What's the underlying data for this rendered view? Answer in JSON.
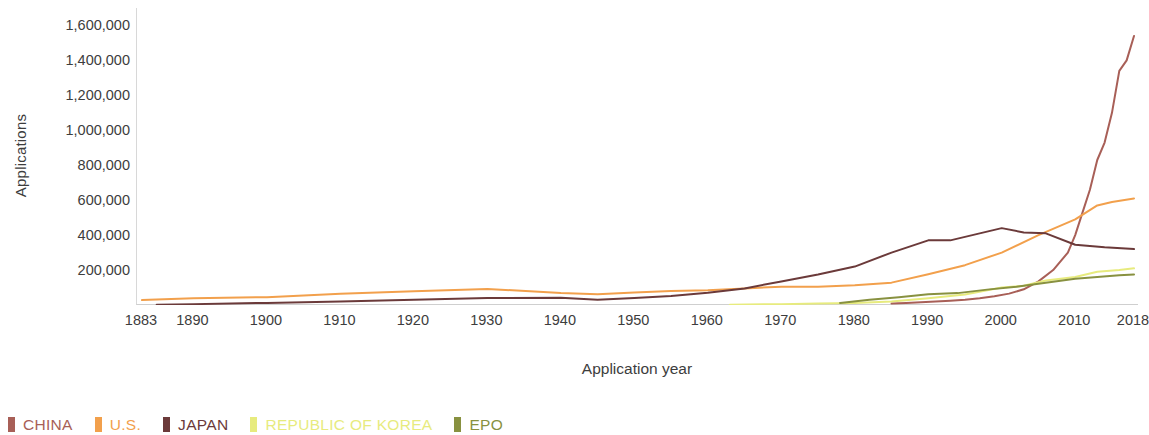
{
  "chart_data": {
    "type": "line",
    "title": "",
    "xlabel": "Application year",
    "ylabel": "Applications",
    "xlim": [
      1883,
      2018
    ],
    "ylim": [
      0,
      1700000
    ],
    "grid": false,
    "legend_position": "bottom-left",
    "x_ticks": [
      "1883",
      "1890",
      "1900",
      "1910",
      "1920",
      "1930",
      "1940",
      "1950",
      "1960",
      "1970",
      "1980",
      "1990",
      "2000",
      "2010",
      "2018"
    ],
    "x_tick_values": [
      1883,
      1890,
      1900,
      1910,
      1920,
      1930,
      1940,
      1950,
      1960,
      1970,
      1980,
      1990,
      2000,
      2010,
      2018
    ],
    "y_ticks": [
      "200,000",
      "400,000",
      "600,000",
      "800,000",
      "1,000,000",
      "1,200,000",
      "1,400,000",
      "1,600,000"
    ],
    "y_tick_values": [
      200000,
      400000,
      600000,
      800000,
      1000000,
      1200000,
      1400000,
      1600000
    ],
    "series": [
      {
        "name": "CHINA",
        "color": "#a85f57",
        "x": [
          1985,
          1987,
          1989,
          1991,
          1993,
          1995,
          1997,
          1999,
          2001,
          2003,
          2005,
          2007,
          2009,
          2010,
          2011,
          2012,
          2013,
          2014,
          2015,
          2016,
          2017,
          2018
        ],
        "values": [
          9000,
          12000,
          16000,
          20000,
          25000,
          30000,
          38000,
          50000,
          65000,
          90000,
          135000,
          200000,
          300000,
          400000,
          530000,
          660000,
          830000,
          930000,
          1100000,
          1340000,
          1400000,
          1540000
        ]
      },
      {
        "name": "U.S.",
        "color": "#f2a04c",
        "x": [
          1883,
          1890,
          1900,
          1910,
          1920,
          1930,
          1940,
          1945,
          1950,
          1955,
          1960,
          1965,
          1970,
          1975,
          1980,
          1985,
          1990,
          1995,
          2000,
          2005,
          2010,
          2013,
          2015,
          2018
        ],
        "values": [
          28000,
          38000,
          45000,
          65000,
          78000,
          92000,
          68000,
          62000,
          72000,
          80000,
          85000,
          95000,
          105000,
          105000,
          113000,
          128000,
          176000,
          228000,
          300000,
          400000,
          490000,
          570000,
          590000,
          610000
        ]
      },
      {
        "name": "JAPAN",
        "color": "#6b3a3a",
        "x": [
          1885,
          1890,
          1900,
          1910,
          1920,
          1930,
          1940,
          1945,
          1950,
          1955,
          1960,
          1965,
          1970,
          1975,
          1980,
          1985,
          1990,
          1993,
          1996,
          2000,
          2003,
          2006,
          2010,
          2014,
          2018
        ],
        "values": [
          1500,
          5000,
          12000,
          20000,
          30000,
          40000,
          42000,
          30000,
          40000,
          52000,
          70000,
          95000,
          135000,
          175000,
          220000,
          300000,
          370000,
          370000,
          400000,
          440000,
          415000,
          410000,
          345000,
          330000,
          320000
        ]
      },
      {
        "name": "REPUBLIC OF KOREA",
        "color": "#e7eb7e",
        "x": [
          1963,
          1970,
          1975,
          1980,
          1985,
          1990,
          1995,
          2000,
          2003,
          2006,
          2010,
          2013,
          2016,
          2018
        ],
        "values": [
          2000,
          5000,
          8000,
          12000,
          20000,
          38000,
          60000,
          100000,
          110000,
          140000,
          160000,
          190000,
          200000,
          210000
        ]
      },
      {
        "name": "EPO",
        "color": "#889140",
        "x": [
          1978,
          1982,
          1986,
          1990,
          1994,
          1998,
          2002,
          2006,
          2010,
          2013,
          2016,
          2018
        ],
        "values": [
          12000,
          30000,
          45000,
          62000,
          68000,
          88000,
          105000,
          128000,
          150000,
          160000,
          170000,
          175000
        ]
      }
    ]
  },
  "axis": {
    "y_title": "Applications",
    "x_title": "Application year"
  },
  "legend": {
    "items": [
      {
        "label": "CHINA",
        "color": "#a85f57"
      },
      {
        "label": "U.S.",
        "color": "#f2a04c"
      },
      {
        "label": "JAPAN",
        "color": "#6b3a3a"
      },
      {
        "label": "REPUBLIC OF KOREA",
        "color": "#e7eb7e"
      },
      {
        "label": "EPO",
        "color": "#889140"
      }
    ]
  }
}
